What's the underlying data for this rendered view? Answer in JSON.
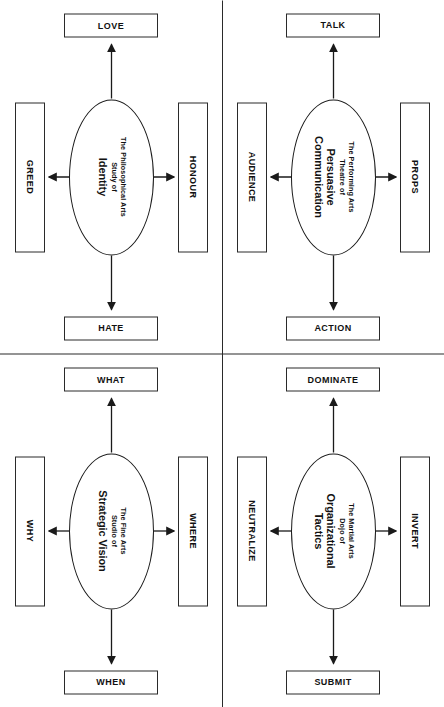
{
  "diagram": {
    "type": "four-quadrant concept diagram",
    "layout": "2x2 grid of hub-and-spoke diagrams separated by a cross divider",
    "colors": {
      "background": "#ffffff",
      "stroke": "#2a2a2a",
      "text": "#111111"
    },
    "quadrants": [
      {
        "id": "performing-arts",
        "position": "top-left",
        "hub": {
          "prefix": "The Performing Arts\nTheatre of",
          "title": "Persuasive\nCommunication"
        },
        "nodes": {
          "top": "PROPS",
          "left": "TALK",
          "right": "ACTION",
          "bottom": "AUDIENCE"
        }
      },
      {
        "id": "martial-arts",
        "position": "top-right",
        "hub": {
          "prefix": "The Martial Arts\nDojo of",
          "title": "Organizational\nTactics"
        },
        "nodes": {
          "top": "INVERT",
          "left": "DOMINATE",
          "right": "SUBMIT",
          "bottom": "NEUTRALIZE"
        }
      },
      {
        "id": "philosophical-arts",
        "position": "bottom-left",
        "hub": {
          "prefix": "The Philosophical Arts\nStudy of",
          "title": "Identity"
        },
        "nodes": {
          "top": "HONOUR",
          "left": "LOVE",
          "right": "HATE",
          "bottom": "GREED"
        }
      },
      {
        "id": "fine-arts",
        "position": "bottom-right",
        "hub": {
          "prefix": "The Fine Arts\nStudio of",
          "title": "Strategic Vision"
        },
        "nodes": {
          "top": "WHERE",
          "left": "WHAT",
          "right": "WHEN",
          "bottom": "WHY"
        }
      }
    ]
  }
}
